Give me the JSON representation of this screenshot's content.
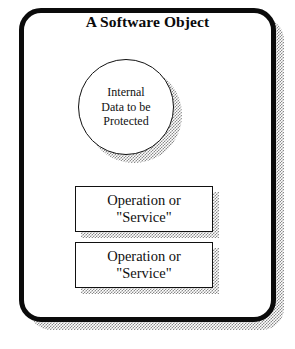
{
  "figure": {
    "title": "A Software Object",
    "background_color": "#ffffff",
    "ink_color": "#0b0b0b",
    "shadow_color": "#8a8a8a"
  },
  "object_container": {
    "name": "software-object-boundary",
    "title": "A Software Object"
  },
  "internal_data": {
    "shape": "circle",
    "line1": "Internal",
    "line2": "Data to be",
    "line3": "Protected"
  },
  "operations": [
    {
      "shape": "rectangle",
      "line1": "Operation or",
      "line2": "\"Service\""
    },
    {
      "shape": "rectangle",
      "line1": "Operation or",
      "line2": "\"Service\""
    }
  ]
}
